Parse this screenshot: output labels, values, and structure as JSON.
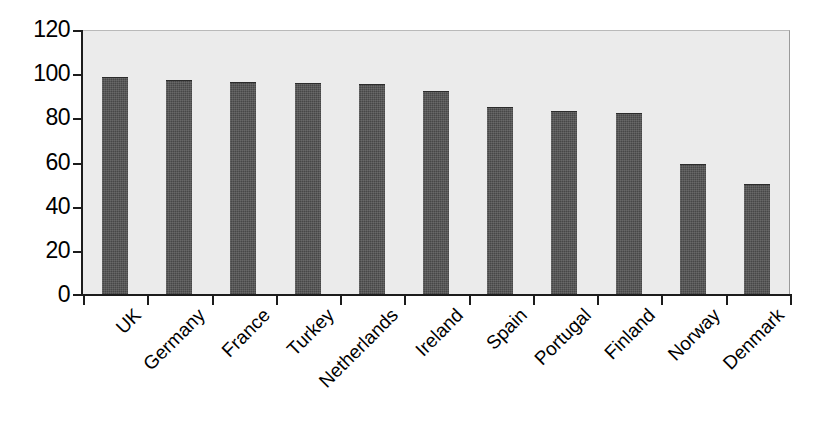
{
  "chart_data": {
    "type": "bar",
    "title": "",
    "subtitle": "",
    "xlabel": "",
    "ylabel": "",
    "categories": [
      "UK",
      "Germany",
      "France",
      "Turkey",
      "Netherlands",
      "Ireland",
      "Spain",
      "Portugal",
      "Finland",
      "Norway",
      "Denmark"
    ],
    "values": [
      98.5,
      97.3,
      96.3,
      96.1,
      95.4,
      92.3,
      85.3,
      83.4,
      82.4,
      59.5,
      50.4
    ],
    "ylim": [
      0,
      120
    ],
    "ytick_labels": [
      "120",
      "100",
      "80",
      "60",
      "40",
      "20",
      "0"
    ],
    "yticks": [
      120,
      100,
      80,
      60,
      40,
      20,
      0
    ],
    "grid": false,
    "legend": null,
    "legend_position": "none",
    "series": [
      {
        "name": "",
        "values": [
          98.5,
          97.3,
          96.3,
          96.1,
          95.4,
          92.3,
          85.3,
          83.4,
          82.4,
          59.5,
          50.4
        ]
      }
    ],
    "annotations": [],
    "colors": {
      "bar_fill": "#474747",
      "plot_background": "#ebebeb",
      "axis": "#1c1c1c",
      "figure_background": "#ffffff",
      "text": "#000000"
    },
    "x_label_rotation": -45
  }
}
